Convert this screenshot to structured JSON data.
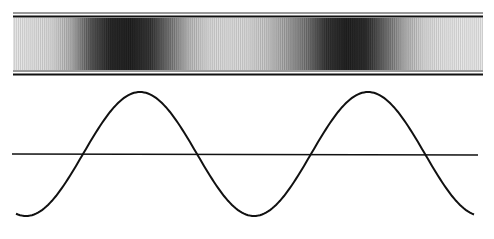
{
  "figure": {
    "type": "illustration",
    "colors": {
      "ink": "#111111",
      "paper": "#ffffff",
      "band_light": "#f2f2f2",
      "band_dark": "#1a1a1a"
    },
    "band": {
      "dark_regions_as_wave_phase": [
        "trough-to-crest rising",
        "trough-to-crest rising"
      ],
      "intensity_profile": [
        0.05,
        0.08,
        0.12,
        0.3,
        0.7,
        0.92,
        0.95,
        0.85,
        0.55,
        0.25,
        0.12,
        0.1,
        0.12,
        0.2,
        0.35,
        0.55,
        0.85,
        0.95,
        0.9,
        0.6,
        0.3,
        0.12,
        0.07,
        0.05,
        0.05
      ]
    },
    "wave": {
      "cycles_visible": 2.0,
      "phase": "starts at trough, two crests",
      "axis_line": true
    }
  }
}
